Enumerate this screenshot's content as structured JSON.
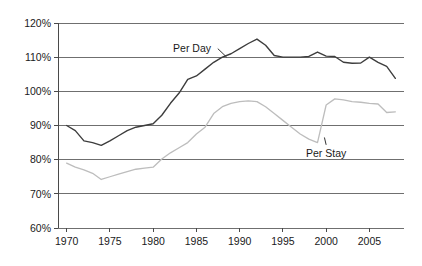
{
  "chart_data": {
    "type": "line",
    "title": "",
    "subtitle": "",
    "xlabel": "",
    "ylabel": "",
    "xlim": [
      1969,
      2009
    ],
    "ylim": [
      60,
      120
    ],
    "grid": true,
    "grid_axis": "y",
    "legend_position": "inline-annotation",
    "x_tick_labels": [
      "1970",
      "1975",
      "1980",
      "1985",
      "1990",
      "1995",
      "2000",
      "2005"
    ],
    "x_tick_values": [
      1970,
      1975,
      1980,
      1985,
      1990,
      1995,
      2000,
      2005
    ],
    "y_tick_labels": [
      "60%",
      "70%",
      "80%",
      "90%",
      "100%",
      "110%",
      "120%"
    ],
    "y_tick_values": [
      60,
      70,
      80,
      90,
      100,
      110,
      120
    ],
    "x": [
      1970,
      1971,
      1972,
      1973,
      1974,
      1975,
      1976,
      1977,
      1978,
      1979,
      1980,
      1981,
      1982,
      1983,
      1984,
      1985,
      1986,
      1987,
      1988,
      1989,
      1990,
      1991,
      1992,
      1993,
      1994,
      1995,
      1996,
      1997,
      1998,
      1999,
      2000,
      2001,
      2002,
      2003,
      2004,
      2005,
      2006,
      2007,
      2008
    ],
    "series": [
      {
        "name": "Per Day",
        "color": "#3d3d3d",
        "annotation": "Per Day",
        "values": [
          90.0,
          88.5,
          85.5,
          85.0,
          84.2,
          85.5,
          87.0,
          88.5,
          89.5,
          90.0,
          90.5,
          93.0,
          96.5,
          99.5,
          103.5,
          104.5,
          106.5,
          108.5,
          110.0,
          111.0,
          112.5,
          114.0,
          115.3,
          113.5,
          110.5,
          110.0,
          110.0,
          110.0,
          110.2,
          111.5,
          110.3,
          110.2,
          108.5,
          108.2,
          108.3,
          110.0,
          108.5,
          107.3,
          103.8
        ]
      },
      {
        "name": "Per Stay",
        "color": "#bdbdbd",
        "annotation": "Per Stay",
        "values": [
          79.0,
          77.8,
          77.0,
          76.0,
          74.2,
          75.0,
          75.8,
          76.5,
          77.2,
          77.5,
          77.8,
          80.2,
          82.0,
          83.5,
          85.0,
          87.5,
          89.5,
          93.5,
          95.5,
          96.5,
          97.0,
          97.2,
          97.0,
          95.5,
          93.5,
          91.5,
          89.5,
          87.5,
          86.0,
          85.0,
          96.0,
          97.8,
          97.5,
          97.0,
          96.8,
          96.5,
          96.3,
          93.8,
          94.0
        ]
      }
    ],
    "annotations": [
      {
        "text": "Per Day",
        "anchor_x": 1984.5,
        "anchor_y": 112.5,
        "leader_to_x": 1988.5,
        "leader_to_y": 110.0
      },
      {
        "text": "Per Stay",
        "anchor_x": 2000.0,
        "anchor_y": 82.0,
        "leader_to_x": 1999.8,
        "leader_to_y": 86.5
      }
    ]
  },
  "colors": {
    "background": "#ffffff",
    "gridline": "#6f6f6f",
    "axis": "#4a4a4a",
    "text": "#1a1a1a",
    "series_primary": "#3d3d3d",
    "series_secondary": "#bdbdbd"
  },
  "axes": {
    "y_labels": [
      "120%",
      "110%",
      "100%",
      "90%",
      "80%",
      "70%",
      "60%"
    ],
    "x_labels": [
      "1970",
      "1975",
      "1980",
      "1985",
      "1990",
      "1995",
      "2000",
      "2005"
    ]
  },
  "labels": {
    "per_day": "Per Day",
    "per_stay": "Per Stay"
  }
}
